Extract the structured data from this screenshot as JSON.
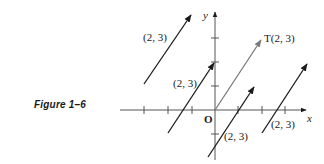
{
  "figure": {
    "caption": "Figure 1–6",
    "x_axis_label": "x",
    "y_axis_label": "y",
    "origin_label": "O",
    "vectors": [
      {
        "label": "(2, 3)",
        "tail": [
          -3,
          1
        ],
        "color": "#1a1a1a"
      },
      {
        "label": "(2, 3)",
        "tail": [
          -2,
          -1
        ],
        "color": "#1a1a1a"
      },
      {
        "label": "T(2, 3)",
        "tail": [
          0,
          0
        ],
        "color": "#7a7a7a"
      },
      {
        "label": "(2, 3)",
        "tail": [
          -0.3,
          -2
        ],
        "color": "#1a1a1a"
      },
      {
        "label": "(2, 3)",
        "tail": [
          2,
          -1
        ],
        "color": "#1a1a1a"
      }
    ],
    "colors": {
      "ink": "#1a1a1a",
      "translation_vector": "#7a7a7a",
      "axis": "#555555"
    }
  }
}
